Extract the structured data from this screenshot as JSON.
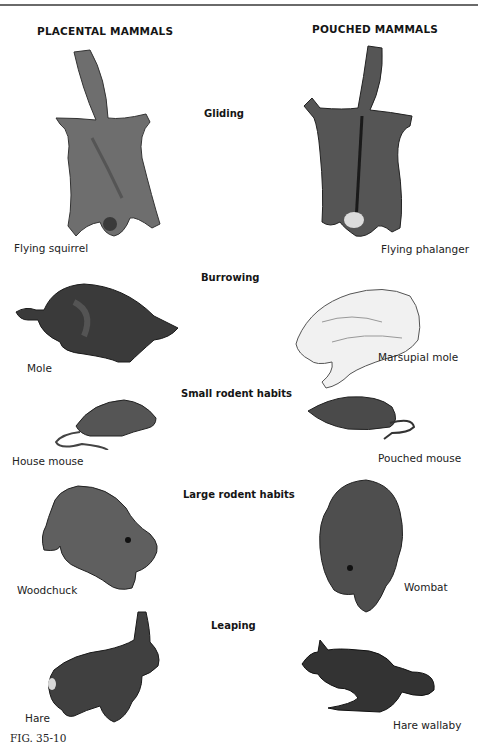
{
  "columns": {
    "left": "PLACENTAL MAMMALS",
    "right": "POUCHED MAMMALS"
  },
  "rows": [
    {
      "habit": "Gliding",
      "placental": "Flying squirrel",
      "pouched": "Flying phalanger"
    },
    {
      "habit": "Burrowing",
      "placental": "Mole",
      "pouched": "Marsupial mole"
    },
    {
      "habit": "Small rodent habits",
      "placental": "House mouse",
      "pouched": "Pouched mouse"
    },
    {
      "habit": "Large rodent habits",
      "placental": "Woodchuck",
      "pouched": "Wombat"
    },
    {
      "habit": "Leaping",
      "placental": "Hare",
      "pouched": "Hare wallaby"
    }
  ],
  "figure_caption": "FIG. 35-10"
}
